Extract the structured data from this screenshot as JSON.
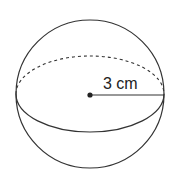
{
  "diagram": {
    "shape": "sphere",
    "radius_label": "3 cm",
    "stroke_color": "#333333",
    "fill_color": "#ffffff"
  }
}
